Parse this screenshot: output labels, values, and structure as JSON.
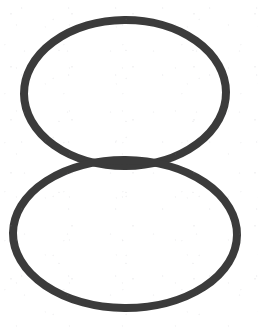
{
  "image": {
    "kind": "line-drawing",
    "subject": "figure-eight outline formed by two stacked tangent ellipses",
    "alt_text": "A hand-drawn figure eight made of two hollow ellipses stacked vertically and touching in the middle",
    "width_px": 258,
    "height_px": 328
  },
  "colors": {
    "background": "#ffffff",
    "stroke": "#3b3b3b",
    "stroke_shadow": "#2e2e2e"
  },
  "stroke": {
    "width_px": 8,
    "linecap": "round",
    "style": "solid"
  },
  "shapes": [
    {
      "name": "upper-ellipse",
      "role": "top lobe of the figure eight",
      "center_x": 125,
      "center_y": 93,
      "radius_x": 101,
      "radius_y": 73,
      "rotation_deg": -0.5,
      "fill": "none"
    },
    {
      "name": "lower-ellipse",
      "role": "bottom lobe of the figure eight",
      "center_x": 125,
      "center_y": 234,
      "radius_x": 112,
      "radius_y": 74,
      "rotation_deg": 0.5,
      "fill": "none"
    }
  ],
  "junction": {
    "name": "tangent-band",
    "description": "horizontal band where the two ellipse outlines meet and overlap",
    "center_x": 125,
    "center_y": 164,
    "left_crossing_x": 97,
    "right_crossing_x": 175
  }
}
